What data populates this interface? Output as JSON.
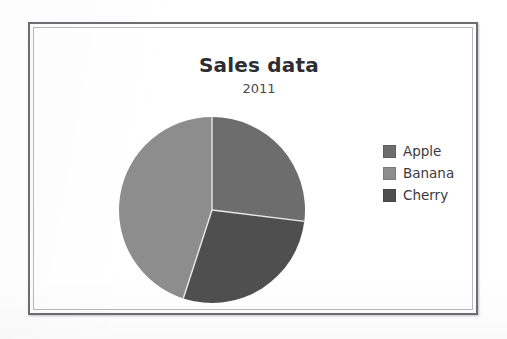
{
  "chart_data": {
    "type": "pie",
    "title": "Sales data",
    "subtitle": "2011",
    "categories": [
      "Apple",
      "Banana",
      "Cherry"
    ],
    "values": [
      27,
      45,
      28
    ],
    "units": "percent",
    "legend_position": "right",
    "grid": false,
    "xlabel": "",
    "ylabel": "",
    "slices": [
      {
        "label": "Apple",
        "value": 27,
        "color": "#6d6d6d",
        "start_angle_deg": 0,
        "end_angle_deg": 97
      },
      {
        "label": "Cherry",
        "value": 28,
        "color": "#4f4f4f",
        "start_angle_deg": 97,
        "end_angle_deg": 198
      },
      {
        "label": "Banana",
        "value": 45,
        "color": "#8d8d8d",
        "start_angle_deg": 198,
        "end_angle_deg": 360
      }
    ]
  },
  "legend": {
    "items": [
      {
        "label": "Apple",
        "color": "#6d6d6d"
      },
      {
        "label": "Banana",
        "color": "#8d8d8d"
      },
      {
        "label": "Cherry",
        "color": "#4f4f4f"
      }
    ]
  },
  "style": {
    "frame_border_color": "#6e6e72",
    "plot_background": "#ffffff",
    "slice_divider_color": "#e8e8e8",
    "title_color": "#2e2e32",
    "subtitle_color": "#4a4a4e",
    "legend_text_color": "#3a3a3e"
  }
}
